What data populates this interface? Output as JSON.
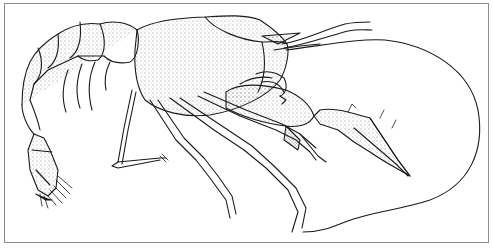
{
  "figure": {
    "style": "stippled pen-and-ink line drawing",
    "border_color": "#8c8c8c",
    "ink_color": "#1a1a1a",
    "background": "#ffffff"
  }
}
